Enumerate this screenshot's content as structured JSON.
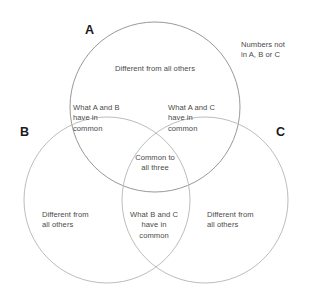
{
  "diagram": {
    "type": "venn-3-set",
    "background_color": "#ffffff",
    "stroke_color": "#8c8c8c",
    "text_color": "#4a4a4a",
    "letter_color": "#1a1a1a",
    "sets": [
      {
        "id": "A",
        "letter": "A",
        "cx": 155,
        "cy": 107,
        "r": 85
      },
      {
        "id": "B",
        "letter": "B",
        "cx": 107,
        "cy": 200,
        "r": 83
      },
      {
        "id": "C",
        "letter": "C",
        "cx": 205,
        "cy": 200,
        "r": 83
      }
    ],
    "regions": {
      "outside": "Numbers not\nin A, B or C",
      "a_only": "Different from all others",
      "a_and_b": "What A and B\nhave in\ncommon",
      "a_and_c": "What A and C\nhave in\ncommon",
      "a_b_and_c": "Common to\nall three",
      "b_and_c": "What B and C\nhave in\ncommon",
      "b_only": "Different from\nall others",
      "c_only": "Different from\nall others"
    }
  }
}
